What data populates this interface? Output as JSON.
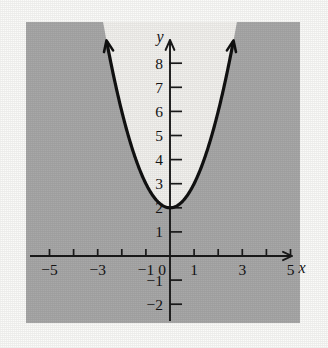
{
  "figure": {
    "title": "",
    "paper_background": "#fbfbf9",
    "panel_background": "#a8a8a8",
    "unshaded_region_color": "#f2f1ee",
    "curve_color": "#111111",
    "axis_color": "#1a1a1a",
    "x_axis_label": "x",
    "y_axis_label": "y"
  },
  "chart_data": {
    "type": "line",
    "title": "",
    "xlabel": "x",
    "ylabel": "y",
    "grid": false,
    "legend": null,
    "xlim": [
      -6.0,
      5.9
    ],
    "ylim": [
      -2.9,
      9.0
    ],
    "x_ticks": [
      -5,
      -4,
      -3,
      -2,
      -1,
      0,
      1,
      2,
      3,
      4,
      5
    ],
    "x_tick_labels": [
      "−5",
      "",
      "−3",
      "",
      "−1",
      "0",
      "1",
      "",
      "3",
      "",
      "5"
    ],
    "y_ticks": [
      -2,
      -1,
      1,
      2,
      3,
      4,
      5,
      6,
      7,
      8
    ],
    "y_tick_labels": [
      "−2",
      "−1",
      "1",
      "2",
      "3",
      "4",
      "5",
      "6",
      "7",
      "8"
    ],
    "series": [
      {
        "name": "y = x² + 2",
        "equation": "y = x^2 + 2",
        "vertex": [
          0,
          2
        ],
        "style": "solid",
        "arrow_start": true,
        "arrow_end": true,
        "x": [
          -2.6,
          -2.4,
          -2.2,
          -2.0,
          -1.8,
          -1.6,
          -1.4,
          -1.2,
          -1.0,
          -0.8,
          -0.6,
          -0.4,
          -0.2,
          0.0,
          0.2,
          0.4,
          0.6,
          0.8,
          1.0,
          1.2,
          1.4,
          1.6,
          1.8,
          2.0,
          2.2,
          2.4,
          2.6
        ],
        "values": [
          8.76,
          7.76,
          6.84,
          6.0,
          5.24,
          4.56,
          3.96,
          3.44,
          3.0,
          2.64,
          2.36,
          2.16,
          2.04,
          2.0,
          2.04,
          2.16,
          2.36,
          2.64,
          3.0,
          3.44,
          3.96,
          4.56,
          5.24,
          6.0,
          6.84,
          7.76,
          8.76
        ]
      }
    ],
    "shaded_region": {
      "description": "region outside (below) the parabola is shaded gray; interior above the parabola is unshaded",
      "inequality": "y < x^2 + 2",
      "shaded_side": "outside"
    }
  }
}
